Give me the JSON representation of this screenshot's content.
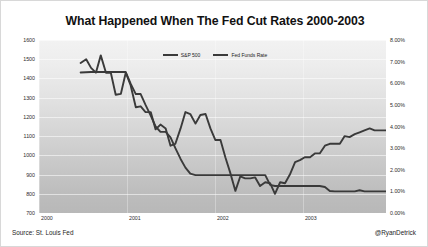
{
  "chart_data": {
    "type": "line",
    "title": "What Happened When The Fed Cut Rates 2000-2003",
    "xlabel": "",
    "ylabel": "",
    "grid": true,
    "legend_position": "top-center",
    "y_left": {
      "label": "S&P 500",
      "ticks": [
        "1600",
        "1500",
        "1400",
        "1300",
        "1200",
        "1100",
        "1000",
        "900",
        "800",
        "700"
      ],
      "min": 700,
      "max": 1600,
      "step": 100
    },
    "y_right": {
      "label": "Fed Funds Rate",
      "ticks": [
        "8.00%",
        "7.00%",
        "6.00%",
        "5.00%",
        "4.00%",
        "3.00%",
        "2.00%",
        "1.00%",
        "0.00%"
      ],
      "min": 0,
      "max": 8,
      "step": 1
    },
    "x_ticks": [
      "2000",
      "2001",
      "2002",
      "2003"
    ],
    "x_tick_positions": [
      0.0,
      0.2535,
      0.507,
      0.7605
    ],
    "xlim": [
      0,
      1
    ],
    "series": [
      {
        "name": "S&P 500",
        "axis": "left",
        "color": "#3a3a3a",
        "points": [
          [
            0.12,
            1480
          ],
          [
            0.136,
            1500
          ],
          [
            0.15,
            1455
          ],
          [
            0.164,
            1430
          ],
          [
            0.178,
            1520
          ],
          [
            0.193,
            1430
          ],
          [
            0.207,
            1430
          ],
          [
            0.221,
            1315
          ],
          [
            0.236,
            1320
          ],
          [
            0.25,
            1430
          ],
          [
            0.264,
            1365
          ],
          [
            0.279,
            1250
          ],
          [
            0.293,
            1255
          ],
          [
            0.307,
            1225
          ],
          [
            0.322,
            1225
          ],
          [
            0.336,
            1135
          ],
          [
            0.35,
            1160
          ],
          [
            0.365,
            1140
          ],
          [
            0.379,
            1050
          ],
          [
            0.393,
            1060
          ],
          [
            0.408,
            1140
          ],
          [
            0.422,
            1225
          ],
          [
            0.436,
            1215
          ],
          [
            0.451,
            1165
          ],
          [
            0.465,
            1210
          ],
          [
            0.48,
            1215
          ],
          [
            0.494,
            1140
          ],
          [
            0.508,
            1080
          ],
          [
            0.523,
            1080
          ],
          [
            0.537,
            990
          ],
          [
            0.551,
            910
          ],
          [
            0.566,
            815
          ],
          [
            0.58,
            890
          ],
          [
            0.594,
            880
          ],
          [
            0.609,
            880
          ],
          [
            0.623,
            885
          ],
          [
            0.637,
            840
          ],
          [
            0.652,
            860
          ],
          [
            0.666,
            855
          ],
          [
            0.68,
            800
          ],
          [
            0.695,
            860
          ],
          [
            0.709,
            855
          ],
          [
            0.723,
            900
          ],
          [
            0.738,
            965
          ],
          [
            0.752,
            975
          ],
          [
            0.766,
            990
          ],
          [
            0.781,
            990
          ],
          [
            0.795,
            1010
          ],
          [
            0.809,
            1010
          ],
          [
            0.824,
            1050
          ],
          [
            0.838,
            1060
          ],
          [
            0.852,
            1060
          ],
          [
            0.867,
            1060
          ],
          [
            0.881,
            1100
          ],
          [
            0.895,
            1095
          ],
          [
            0.91,
            1110
          ],
          [
            0.924,
            1120
          ],
          [
            0.938,
            1130
          ],
          [
            0.953,
            1140
          ],
          [
            0.967,
            1130
          ],
          [
            0.982,
            1130
          ],
          [
            1.0,
            1130
          ]
        ]
      },
      {
        "name": "Fed Funds Rate",
        "axis": "right",
        "color": "#3a3a3a",
        "points": [
          [
            0.12,
            6.5
          ],
          [
            0.15,
            6.52
          ],
          [
            0.178,
            6.52
          ],
          [
            0.207,
            6.52
          ],
          [
            0.236,
            6.52
          ],
          [
            0.25,
            6.52
          ],
          [
            0.264,
            5.98
          ],
          [
            0.279,
            5.5
          ],
          [
            0.293,
            5.5
          ],
          [
            0.307,
            5.0
          ],
          [
            0.322,
            4.5
          ],
          [
            0.336,
            4.0
          ],
          [
            0.35,
            3.75
          ],
          [
            0.365,
            3.75
          ],
          [
            0.379,
            3.5
          ],
          [
            0.393,
            3.0
          ],
          [
            0.408,
            2.5
          ],
          [
            0.422,
            2.1
          ],
          [
            0.436,
            1.82
          ],
          [
            0.451,
            1.75
          ],
          [
            0.465,
            1.75
          ],
          [
            0.48,
            1.75
          ],
          [
            0.494,
            1.75
          ],
          [
            0.508,
            1.75
          ],
          [
            0.523,
            1.75
          ],
          [
            0.537,
            1.75
          ],
          [
            0.551,
            1.75
          ],
          [
            0.566,
            1.75
          ],
          [
            0.58,
            1.75
          ],
          [
            0.594,
            1.75
          ],
          [
            0.609,
            1.75
          ],
          [
            0.623,
            1.75
          ],
          [
            0.637,
            1.75
          ],
          [
            0.652,
            1.75
          ],
          [
            0.666,
            1.3
          ],
          [
            0.68,
            1.25
          ],
          [
            0.695,
            1.25
          ],
          [
            0.709,
            1.25
          ],
          [
            0.723,
            1.25
          ],
          [
            0.738,
            1.25
          ],
          [
            0.752,
            1.25
          ],
          [
            0.766,
            1.25
          ],
          [
            0.781,
            1.25
          ],
          [
            0.795,
            1.25
          ],
          [
            0.809,
            1.25
          ],
          [
            0.824,
            1.2
          ],
          [
            0.838,
            1.02
          ],
          [
            0.852,
            1.0
          ],
          [
            0.867,
            1.0
          ],
          [
            0.881,
            1.0
          ],
          [
            0.895,
            1.0
          ],
          [
            0.91,
            1.0
          ],
          [
            0.924,
            1.05
          ],
          [
            0.938,
            1.0
          ],
          [
            0.953,
            1.0
          ],
          [
            0.967,
            1.0
          ],
          [
            0.982,
            1.0
          ],
          [
            1.0,
            1.0
          ]
        ]
      }
    ]
  },
  "legend": {
    "items": [
      {
        "label": "S&P 500"
      },
      {
        "label": "Fed Funds Rate"
      }
    ]
  },
  "footer": {
    "source": "Source:  St. Louis Fed",
    "credit": "@RyanDetrick"
  }
}
